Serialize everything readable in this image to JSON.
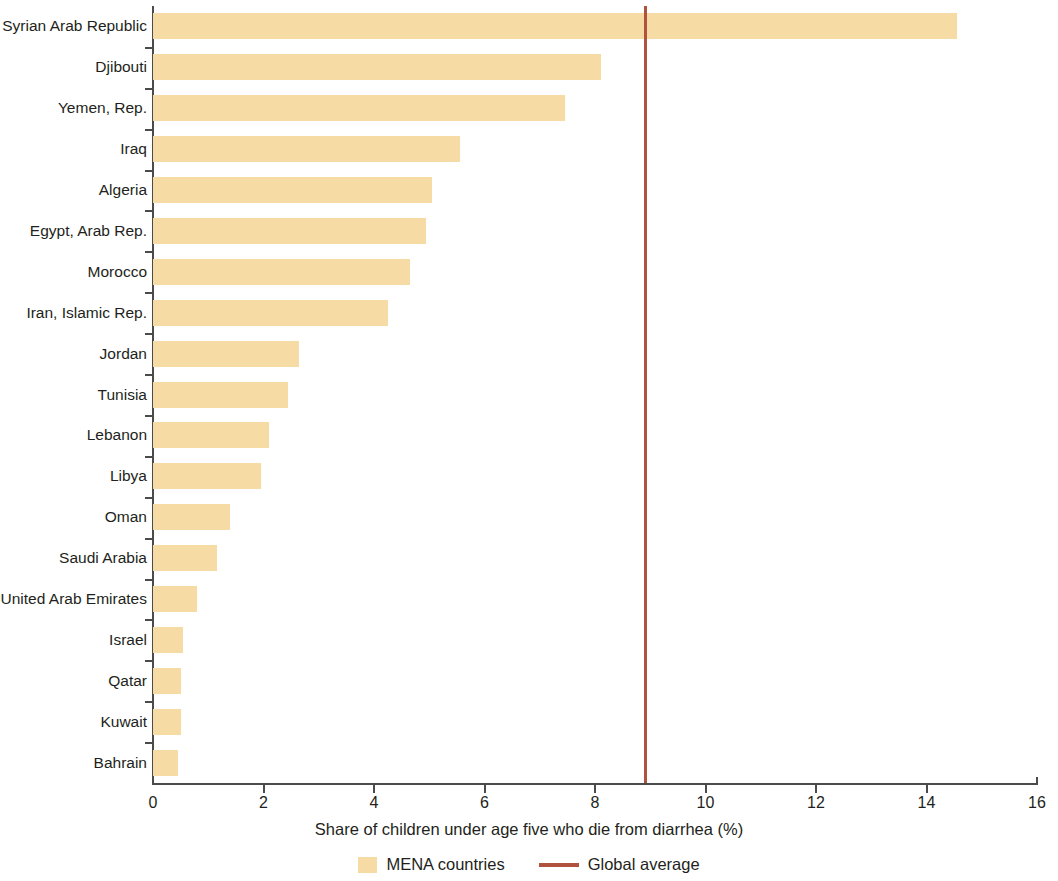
{
  "chart_data": {
    "type": "bar",
    "orientation": "horizontal",
    "title": "",
    "xlabel": "Share of children under age five who die from diarrhea (%)",
    "ylabel": "",
    "xlim": [
      0,
      16
    ],
    "xticks": [
      "0",
      "2",
      "4",
      "6",
      "8",
      "10",
      "12",
      "14",
      "16"
    ],
    "grid": false,
    "legend_position": "bottom",
    "categories": [
      "Syrian Arab Republic",
      "Djibouti",
      "Yemen, Rep.",
      "Iraq",
      "Algeria",
      "Egypt, Arab Rep.",
      "Morocco",
      "Iran, Islamic Rep.",
      "Jordan",
      "Tunisia",
      "Lebanon",
      "Libya",
      "Oman",
      "Saudi Arabia",
      "United Arab Emirates",
      "Israel",
      "Qatar",
      "Kuwait",
      "Bahrain"
    ],
    "series": [
      {
        "name": "MENA countries",
        "color": "#f6dba5",
        "values": [
          14.55,
          8.1,
          7.45,
          5.55,
          5.05,
          4.95,
          4.65,
          4.25,
          2.65,
          2.45,
          2.1,
          1.95,
          1.4,
          1.15,
          0.8,
          0.55,
          0.5,
          0.5,
          0.45
        ]
      }
    ],
    "reference_line": {
      "name": "Global average",
      "value": 8.9,
      "color": "#b0523d"
    },
    "legend": [
      {
        "label": "MENA countries",
        "marker": "box",
        "color": "#f6dba5"
      },
      {
        "label": "Global average",
        "marker": "line",
        "color": "#b0523d"
      }
    ]
  }
}
